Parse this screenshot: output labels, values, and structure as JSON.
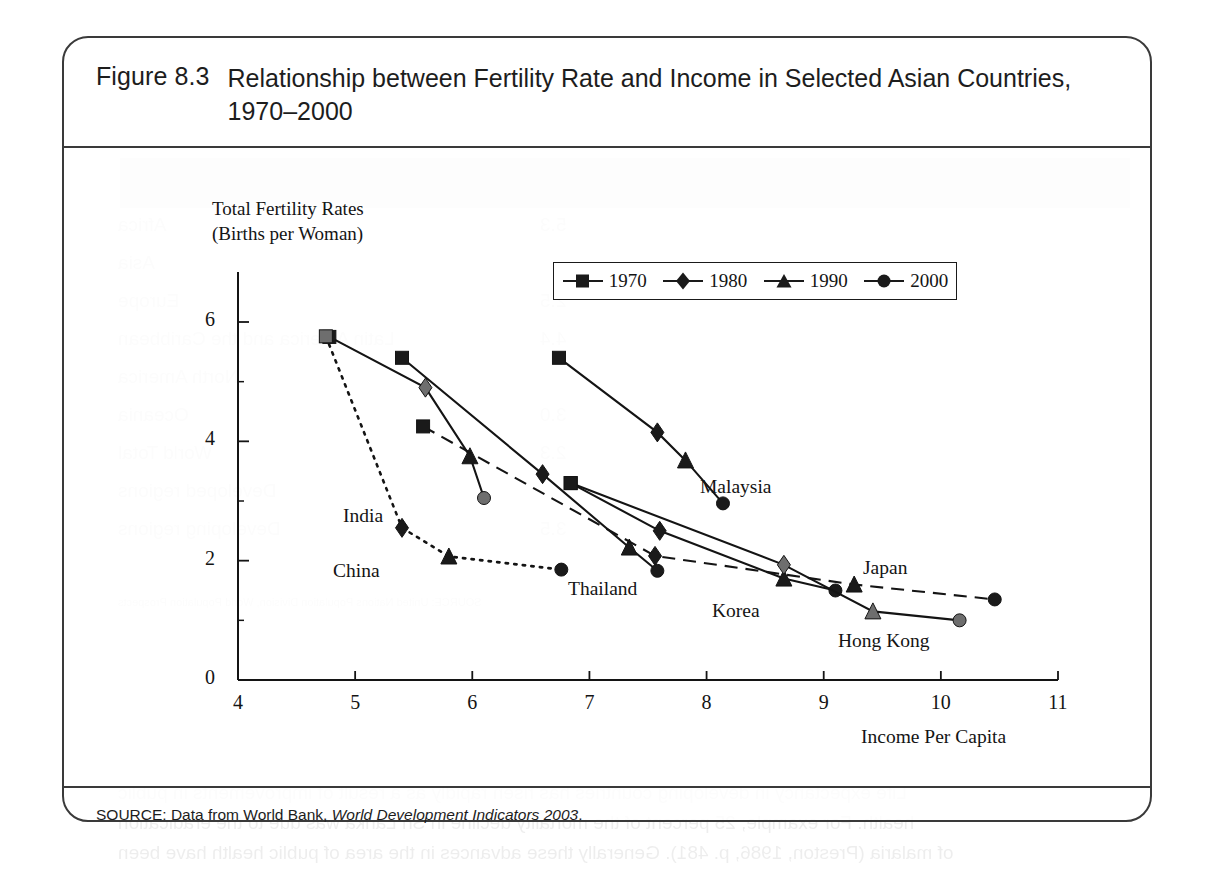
{
  "figure": {
    "number": "Figure 8.3",
    "title": "Relationship between Fertility Rate and Income in Selected Asian Countries, 1970–2000",
    "source_prefix": "SOURCE: Data from World Bank, ",
    "source_italic": "World Development Indicators 2003",
    "source_suffix": "."
  },
  "chart_data": {
    "type": "line",
    "title": "Relationship between Fertility Rate and Income in Selected Asian Countries, 1970–2000",
    "xlabel": "Income Per Capita",
    "ylabel": "Total Fertility Rates (Births per Woman)",
    "ylabel_line1": "Total Fertility Rates",
    "ylabel_line2": "(Births per Woman)",
    "xlim": [
      4,
      11
    ],
    "ylim": [
      0,
      6.6
    ],
    "xticks": [
      4,
      5,
      6,
      7,
      8,
      9,
      10,
      11
    ],
    "xtick_labels": [
      "4",
      "5",
      "6",
      "7",
      "8",
      "9",
      "10",
      "11"
    ],
    "yticks": [
      0,
      2,
      4,
      6
    ],
    "ytick_labels": [
      "0",
      "2",
      "4",
      "6"
    ],
    "yminor_ticks": [
      1,
      3,
      5
    ],
    "grid": false,
    "legend_position": "top-right-inside",
    "legend": [
      {
        "label": "1970",
        "marker": "square"
      },
      {
        "label": "1980",
        "marker": "diamond"
      },
      {
        "label": "1990",
        "marker": "triangle"
      },
      {
        "label": "2000",
        "marker": "circle"
      }
    ],
    "periods": [
      "1970",
      "1980",
      "1990",
      "2000"
    ],
    "series": [
      {
        "name": "India",
        "line_style": "solid",
        "label_position": "left-of-2000-point",
        "points": [
          {
            "period": "1970",
            "x": 4.78,
            "y": 5.75
          },
          {
            "period": "1980",
            "x": 5.6,
            "y": 4.9
          },
          {
            "period": "1990",
            "x": 5.98,
            "y": 3.75
          },
          {
            "period": "2000",
            "x": 6.1,
            "y": 3.05
          }
        ]
      },
      {
        "name": "China",
        "line_style": "dotted",
        "label_position": "below-1990-point",
        "points": [
          {
            "period": "1970",
            "x": 4.75,
            "y": 5.76
          },
          {
            "period": "1980",
            "x": 5.4,
            "y": 2.55
          },
          {
            "period": "1990",
            "x": 5.8,
            "y": 2.07
          },
          {
            "period": "2000",
            "x": 6.76,
            "y": 1.85
          }
        ]
      },
      {
        "name": "Thailand",
        "line_style": "solid",
        "label_position": "below-left",
        "points": [
          {
            "period": "1970",
            "x": 5.4,
            "y": 5.4
          },
          {
            "period": "1980",
            "x": 6.6,
            "y": 3.45
          },
          {
            "period": "1990",
            "x": 7.34,
            "y": 2.22
          },
          {
            "period": "2000",
            "x": 7.58,
            "y": 1.83
          }
        ]
      },
      {
        "name": "Malaysia",
        "line_style": "solid",
        "label_position": "right-of-2000-point",
        "points": [
          {
            "period": "1970",
            "x": 6.74,
            "y": 5.4
          },
          {
            "period": "1980",
            "x": 7.58,
            "y": 4.15
          },
          {
            "period": "1990",
            "x": 7.82,
            "y": 3.68
          },
          {
            "period": "2000",
            "x": 8.14,
            "y": 2.96
          }
        ]
      },
      {
        "name": "Korea",
        "line_style": "solid",
        "label_position": "below-left-of-2000-point",
        "points": [
          {
            "period": "1970",
            "x": 6.84,
            "y": 3.3
          },
          {
            "period": "1980",
            "x": 7.6,
            "y": 2.5
          },
          {
            "period": "1990",
            "x": 8.66,
            "y": 1.7
          },
          {
            "period": "2000",
            "x": 9.1,
            "y": 1.5
          }
        ]
      },
      {
        "name": "Hong Kong",
        "line_style": "solid",
        "label_position": "below-2000-point",
        "points": [
          {
            "period": "1970",
            "x": 6.84,
            "y": 3.3
          },
          {
            "period": "1980",
            "x": 8.66,
            "y": 1.93
          },
          {
            "period": "1990",
            "x": 9.42,
            "y": 1.15
          },
          {
            "period": "2000",
            "x": 10.16,
            "y": 1.0
          }
        ]
      },
      {
        "name": "Japan",
        "line_style": "dashed",
        "label_position": "above-2000-point",
        "points": [
          {
            "period": "1970",
            "x": 5.58,
            "y": 4.25
          },
          {
            "period": "1980",
            "x": 7.56,
            "y": 2.08
          },
          {
            "period": "1990",
            "x": 9.26,
            "y": 1.6
          },
          {
            "period": "2000",
            "x": 10.46,
            "y": 1.35
          }
        ]
      }
    ]
  },
  "colors": {
    "ink": "#141414",
    "rule": "#3a3a3a",
    "marker_fill": "#1a1a1a",
    "marker_fill_gray": "#6e6e6e",
    "page": "#ffffff"
  },
  "bleed_through": {
    "rows": [
      "Africa",
      "Asia",
      "Europe",
      "Latin America and the Caribbean",
      "North America",
      "Oceania",
      "World Total",
      "Developed regions",
      "Developing regions"
    ],
    "header": "Total Fertility   Life Expectancy at   Infant Mortality Rate",
    "header2": "Rate   Birth (Years)   (per 1,000 Births)"
  }
}
